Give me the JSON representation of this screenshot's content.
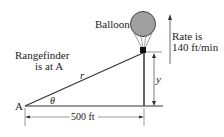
{
  "labels": {
    "balloon": "Balloon",
    "rate_line1": "Rate is",
    "rate_line2": "140 ft/min",
    "rangefinder_line1": "Rangefinder",
    "rangefinder_line2": "is at A",
    "point_a": "A",
    "hypotenuse": "r",
    "angle": "θ",
    "height": "y",
    "distance": "500 ft"
  },
  "colors": {
    "balloon_fill": "#a0a0a0",
    "line": "#333333"
  }
}
